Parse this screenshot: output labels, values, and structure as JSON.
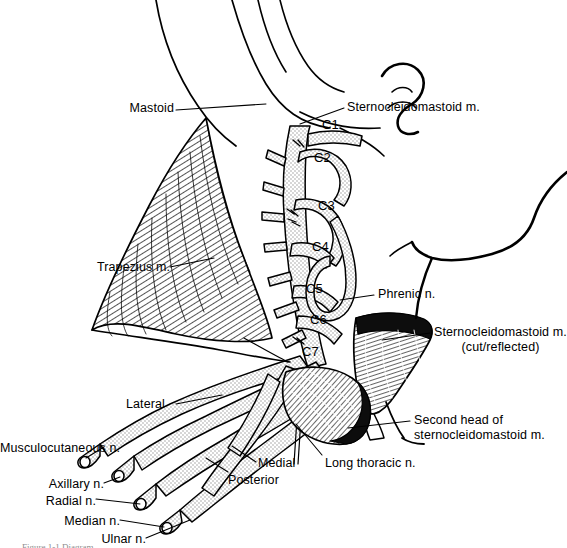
{
  "figure": {
    "caption": "Figure 1-1  Diagram",
    "background_color": "#ffffff",
    "ink_color": "#000000",
    "stipple_color": "#cfcfcf"
  },
  "labels": {
    "mastoid": "Mastoid",
    "trapezius": "Trapezius m.",
    "scm_top": "Sternocleidomastoid m.",
    "phrenic": "Phrenic n.",
    "scm_cut_line1": "Sternocleidomastoid m.",
    "scm_cut_line2": "(cut/reflected)",
    "second_head_line1": "Second head of",
    "second_head_line2": "sternocleidomastoid m.",
    "long_thoracic": "Long thoracic n.",
    "lateral": "Lateral",
    "medial": "Medial",
    "posterior": "Posterior",
    "musculocutaneous": "Musculocutaneous n.",
    "axillary": "Axillary n.",
    "radial": "Radial n.",
    "median": "Median n.",
    "ulnar": "Ulnar n."
  },
  "cervical_roots": [
    {
      "id": "c1",
      "label": "C1"
    },
    {
      "id": "c2",
      "label": "C2"
    },
    {
      "id": "c3",
      "label": "C3"
    },
    {
      "id": "c4",
      "label": "C4"
    },
    {
      "id": "c5",
      "label": "C5"
    },
    {
      "id": "c6",
      "label": "C6"
    },
    {
      "id": "c7",
      "label": "C7"
    }
  ],
  "icons": {
    "head_profile": "head-profile-outline",
    "ear": "ear-outline",
    "trapezius_muscle": "hatched-muscle",
    "scm_muscle": "hatched-muscle",
    "nerve_trunk": "stippled-nerve"
  }
}
